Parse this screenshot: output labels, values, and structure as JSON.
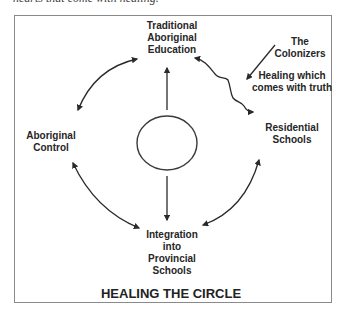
{
  "caption_fragment": "hearts that come with healing.",
  "diagram": {
    "title": "HEALING THE CIRCLE",
    "nodes": {
      "top": {
        "lines": [
          "Traditional",
          "Aboriginal",
          "Education"
        ]
      },
      "left": {
        "lines": [
          "Aboriginal",
          "Control"
        ]
      },
      "right": {
        "lines": [
          "Residential",
          "Schools"
        ]
      },
      "bottom": {
        "lines": [
          "Integration",
          "into",
          "Provincial",
          "Schools"
        ]
      },
      "center": {
        "shape": "circle"
      }
    },
    "annotations": {
      "colonizers": {
        "lines": [
          "The",
          "Colonizers"
        ]
      },
      "healing": {
        "lines": [
          "Healing which",
          "comes with truth"
        ]
      }
    },
    "edges": [
      {
        "from": "left",
        "to": "top",
        "type": "double-arrow-curve"
      },
      {
        "from": "right",
        "to": "top",
        "type": "wavy-double-arrow"
      },
      {
        "from": "left",
        "to": "bottom",
        "type": "double-arrow-curve"
      },
      {
        "from": "bottom",
        "to": "right",
        "type": "double-arrow-curve"
      },
      {
        "from": "center",
        "to": "top",
        "type": "arrow"
      },
      {
        "from": "center",
        "to": "bottom",
        "type": "arrow"
      },
      {
        "from": "colonizers",
        "to": "wavy-line",
        "type": "arrow"
      }
    ],
    "colors": {
      "stroke": "#2a2a2a",
      "frame": "#8a8a8a",
      "text": "#262626"
    }
  }
}
